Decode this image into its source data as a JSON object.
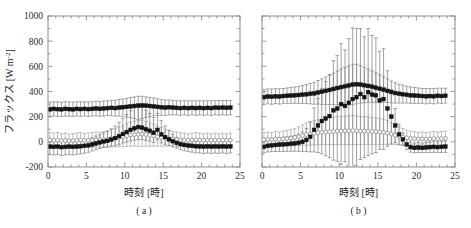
{
  "figure": {
    "panels": [
      {
        "id": "a",
        "label": "( a )"
      },
      {
        "id": "b",
        "label": "( b )"
      }
    ],
    "xlabel": "時刻 [時]",
    "ylabel_main": "フラックス [W m",
    "ylabel_exp": "-2",
    "ylabel_close": "]",
    "ylabel_full": "フラックス [W m-2]"
  },
  "chart_data": [
    {
      "type": "scatter",
      "panel": "a",
      "title": "( a )",
      "xlabel": "時刻 [時]",
      "ylabel": "フラックス [W m-2]",
      "xlim": [
        0,
        25
      ],
      "ylim": [
        -200,
        1000
      ],
      "xticks": [
        0,
        5,
        10,
        15,
        20,
        25
      ],
      "yticks": [
        -200,
        0,
        200,
        400,
        600,
        800,
        1000
      ],
      "xticklabels": [
        "0",
        "5",
        "10",
        "15",
        "20",
        "25"
      ],
      "yticklabels": [
        "-200",
        "0",
        "200",
        "400",
        "600",
        "800",
        "1000"
      ],
      "grid": false,
      "legend": "none",
      "x": [
        0.25,
        0.75,
        1.25,
        1.75,
        2.25,
        2.75,
        3.25,
        3.75,
        4.25,
        4.75,
        5.25,
        5.75,
        6.25,
        6.75,
        7.25,
        7.75,
        8.25,
        8.75,
        9.25,
        9.75,
        10.25,
        10.75,
        11.25,
        11.75,
        12.25,
        12.75,
        13.25,
        13.75,
        14.25,
        14.75,
        15.25,
        15.75,
        16.25,
        16.75,
        17.25,
        17.75,
        18.25,
        18.75,
        19.25,
        19.75,
        20.25,
        20.75,
        21.25,
        21.75,
        22.25,
        22.75,
        23.25,
        23.75
      ],
      "series": [
        {
          "name": "open-circle-series",
          "marker": "open-circle",
          "values": [
            15,
            12,
            14,
            10,
            12,
            8,
            10,
            12,
            14,
            10,
            12,
            14,
            16,
            14,
            18,
            20,
            25,
            28,
            35,
            40,
            48,
            55,
            58,
            60,
            62,
            58,
            52,
            48,
            40,
            35,
            28,
            25,
            20,
            18,
            15,
            14,
            12,
            14,
            16,
            14,
            12,
            14,
            12,
            14,
            12,
            14,
            12,
            14
          ],
          "err_upper": [
            60,
            58,
            60,
            55,
            58,
            52,
            55,
            58,
            60,
            55,
            58,
            60,
            62,
            60,
            65,
            68,
            72,
            75,
            82,
            88,
            95,
            100,
            105,
            108,
            110,
            105,
            98,
            92,
            85,
            80,
            72,
            68,
            62,
            60,
            58,
            55,
            52,
            55,
            58,
            55,
            52,
            55,
            52,
            55,
            52,
            55,
            52,
            55
          ],
          "err_lower": [
            55,
            52,
            55,
            50,
            52,
            48,
            50,
            52,
            55,
            50,
            52,
            55,
            58,
            55,
            60,
            62,
            65,
            68,
            72,
            78,
            85,
            90,
            92,
            95,
            98,
            92,
            88,
            82,
            75,
            70,
            62,
            58,
            55,
            52,
            50,
            48,
            45,
            48,
            52,
            48,
            45,
            48,
            45,
            48,
            45,
            48,
            45,
            48
          ]
        },
        {
          "name": "filled-square-series-low",
          "marker": "filled-square",
          "values": [
            -38,
            -40,
            -38,
            -42,
            -40,
            -38,
            -40,
            -38,
            -35,
            -32,
            -28,
            -20,
            -12,
            -5,
            2,
            8,
            18,
            30,
            45,
            62,
            78,
            95,
            108,
            118,
            112,
            100,
            88,
            72,
            95,
            60,
            38,
            20,
            5,
            -8,
            -18,
            -25,
            -30,
            -32,
            -35,
            -36,
            -38,
            -36,
            -38,
            -36,
            -38,
            -36,
            -38,
            -36
          ],
          "err_upper": [
            40,
            42,
            40,
            44,
            42,
            40,
            42,
            40,
            42,
            45,
            48,
            52,
            58,
            62,
            68,
            75,
            85,
            95,
            110,
            125,
            140,
            152,
            162,
            168,
            162,
            150,
            138,
            122,
            130,
            108,
            88,
            70,
            55,
            45,
            40,
            38,
            36,
            38,
            40,
            40,
            42,
            40,
            42,
            40,
            42,
            40,
            42,
            40
          ],
          "err_lower": [
            62,
            64,
            62,
            66,
            64,
            62,
            64,
            62,
            60,
            58,
            55,
            52,
            50,
            48,
            46,
            48,
            52,
            58,
            65,
            72,
            80,
            88,
            95,
            100,
            95,
            88,
            82,
            75,
            80,
            68,
            58,
            50,
            45,
            42,
            44,
            46,
            48,
            50,
            52,
            52,
            54,
            52,
            54,
            52,
            54,
            52,
            54,
            52
          ]
        },
        {
          "name": "filled-square-series-high",
          "marker": "filled-square",
          "values": [
            258,
            262,
            260,
            258,
            262,
            260,
            258,
            262,
            260,
            262,
            260,
            262,
            265,
            262,
            265,
            268,
            270,
            268,
            272,
            275,
            278,
            282,
            285,
            288,
            290,
            288,
            285,
            282,
            278,
            275,
            272,
            275,
            272,
            270,
            268,
            270,
            268,
            270,
            268,
            270,
            268,
            270,
            268,
            272,
            270,
            272,
            270,
            272
          ],
          "err_upper": [
            58,
            56,
            58,
            56,
            58,
            56,
            58,
            56,
            58,
            56,
            58,
            56,
            58,
            58,
            60,
            58,
            60,
            62,
            64,
            66,
            68,
            70,
            72,
            74,
            72,
            70,
            68,
            66,
            64,
            62,
            60,
            58,
            58,
            56,
            58,
            56,
            58,
            56,
            58,
            56,
            58,
            56,
            58,
            56,
            58,
            56,
            58,
            56
          ],
          "err_lower": [
            58,
            56,
            58,
            56,
            58,
            56,
            58,
            56,
            58,
            56,
            58,
            56,
            58,
            58,
            60,
            58,
            62,
            64,
            68,
            72,
            80,
            90,
            100,
            110,
            105,
            95,
            85,
            75,
            68,
            64,
            62,
            60,
            58,
            56,
            58,
            56,
            58,
            56,
            58,
            56,
            58,
            56,
            58,
            56,
            58,
            56,
            58,
            56
          ]
        }
      ]
    },
    {
      "type": "scatter",
      "panel": "b",
      "title": "( b )",
      "xlabel": "時刻 [時]",
      "ylabel": "フラックス [W m-2]",
      "xlim": [
        0,
        25
      ],
      "ylim": [
        -200,
        1000
      ],
      "xticks": [
        0,
        5,
        10,
        15,
        20,
        25
      ],
      "yticks": [
        -200,
        0,
        200,
        400,
        600,
        800,
        1000
      ],
      "xticklabels": [
        "0",
        "5",
        "10",
        "15",
        "20",
        "25"
      ],
      "yticklabels": [],
      "grid": false,
      "legend": "none",
      "x": [
        0.25,
        0.75,
        1.25,
        1.75,
        2.25,
        2.75,
        3.25,
        3.75,
        4.25,
        4.75,
        5.25,
        5.75,
        6.25,
        6.75,
        7.25,
        7.75,
        8.25,
        8.75,
        9.25,
        9.75,
        10.25,
        10.75,
        11.25,
        11.75,
        12.25,
        12.75,
        13.25,
        13.75,
        14.25,
        14.75,
        15.25,
        15.75,
        16.25,
        16.75,
        17.25,
        17.75,
        18.25,
        18.75,
        19.25,
        19.75,
        20.25,
        20.75,
        21.25,
        21.75,
        22.25,
        22.75,
        23.25,
        23.75
      ],
      "series": [
        {
          "name": "open-circle-series",
          "marker": "open-circle",
          "values": [
            18,
            20,
            18,
            22,
            20,
            24,
            26,
            30,
            35,
            42,
            50,
            58,
            62,
            68,
            72,
            75,
            78,
            80,
            82,
            85,
            86,
            88,
            88,
            90,
            88,
            86,
            85,
            84,
            82,
            80,
            78,
            75,
            70,
            62,
            52,
            44,
            38,
            32,
            28,
            25,
            22,
            24,
            22,
            24,
            26,
            24,
            26,
            28
          ],
          "err_upper": [
            55,
            58,
            55,
            60,
            58,
            62,
            64,
            68,
            72,
            78,
            85,
            92,
            95,
            100,
            102,
            105,
            108,
            110,
            112,
            115,
            116,
            118,
            118,
            120,
            118,
            116,
            115,
            114,
            112,
            110,
            108,
            105,
            100,
            92,
            82,
            74,
            68,
            62,
            58,
            55,
            52,
            54,
            52,
            54,
            56,
            54,
            56,
            58
          ],
          "err_lower": [
            50,
            52,
            50,
            55,
            52,
            56,
            58,
            62,
            66,
            72,
            78,
            85,
            88,
            92,
            95,
            98,
            100,
            102,
            104,
            106,
            108,
            110,
            110,
            112,
            110,
            108,
            106,
            105,
            102,
            100,
            98,
            95,
            90,
            84,
            75,
            68,
            62,
            56,
            52,
            50,
            48,
            50,
            48,
            50,
            52,
            50,
            52,
            54
          ]
        },
        {
          "name": "filled-square-series-low",
          "marker": "filled-square",
          "values": [
            -40,
            -32,
            -28,
            -25,
            -22,
            -20,
            -18,
            -15,
            -12,
            -8,
            0,
            15,
            40,
            95,
            130,
            165,
            185,
            205,
            250,
            265,
            300,
            285,
            310,
            340,
            355,
            380,
            355,
            395,
            375,
            370,
            330,
            340,
            265,
            200,
            130,
            60,
            20,
            -20,
            -42,
            -48,
            -45,
            -48,
            -45,
            -42,
            -40,
            -42,
            -40,
            -38
          ],
          "err_upper": [
            45,
            48,
            50,
            52,
            54,
            56,
            58,
            60,
            62,
            68,
            78,
            92,
            120,
            175,
            215,
            260,
            295,
            330,
            395,
            420,
            480,
            445,
            510,
            565,
            545,
            520,
            480,
            505,
            470,
            455,
            390,
            400,
            300,
            215,
            135,
            80,
            50,
            42,
            40,
            38,
            40,
            38,
            40,
            42,
            44,
            42,
            44,
            46
          ]
        },
        {
          "name": "filled-square-series-high",
          "marker": "filled-square",
          "values": [
            355,
            360,
            358,
            362,
            360,
            364,
            366,
            368,
            370,
            372,
            375,
            378,
            382,
            385,
            392,
            398,
            405,
            412,
            420,
            428,
            435,
            442,
            448,
            455,
            458,
            455,
            450,
            444,
            438,
            430,
            422,
            415,
            405,
            396,
            388,
            382,
            378,
            374,
            370,
            368,
            366,
            364,
            362,
            364,
            362,
            366,
            364,
            366
          ],
          "err_upper": [
            62,
            60,
            62,
            60,
            62,
            60,
            62,
            64,
            66,
            68,
            72,
            76,
            82,
            88,
            95,
            102,
            110,
            118,
            126,
            134,
            142,
            150,
            156,
            162,
            158,
            150,
            142,
            134,
            126,
            118,
            110,
            102,
            95,
            88,
            82,
            76,
            72,
            68,
            66,
            64,
            62,
            60,
            62,
            60,
            62,
            60,
            62,
            60
          ],
          "err_lower": [
            60,
            58,
            60,
            58,
            60,
            58,
            60,
            62,
            64,
            66,
            70,
            74,
            80,
            86,
            92,
            100,
            108,
            116,
            124,
            132,
            140,
            148,
            154,
            160,
            156,
            148,
            140,
            132,
            124,
            116,
            108,
            100,
            92,
            86,
            80,
            74,
            70,
            66,
            64,
            62,
            60,
            58,
            60,
            58,
            60,
            58,
            60,
            58
          ]
        }
      ]
    }
  ]
}
